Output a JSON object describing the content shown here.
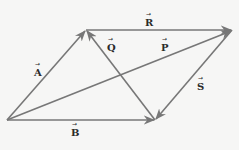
{
  "diagram": {
    "title": "",
    "colors": {
      "background": "#f6f6f5",
      "vector": "#777777",
      "label": "#2a2a2a"
    },
    "points": {
      "origin": [
        7,
        120
      ],
      "top_left": [
        86,
        30
      ],
      "top_right": [
        232,
        30
      ],
      "bottom_right": [
        155,
        120
      ]
    },
    "vectors": [
      {
        "name": "A",
        "label": "A",
        "from": "origin",
        "to": "top_left"
      },
      {
        "name": "R",
        "label": "R",
        "from": "top_left",
        "to": "top_right"
      },
      {
        "name": "B",
        "label": "B",
        "from": "origin",
        "to": "bottom_right"
      },
      {
        "name": "P",
        "label": "P",
        "from": "origin",
        "to": "top_right"
      },
      {
        "name": "Q",
        "label": "Q",
        "from": "bottom_right",
        "to": "top_left"
      },
      {
        "name": "S",
        "label": "S",
        "from": "top_right",
        "to": "bottom_right"
      }
    ],
    "labels": {
      "A": "A",
      "R": "R",
      "B": "B",
      "P": "P",
      "Q": "Q",
      "S": "S",
      "arrow_glyph": "→"
    }
  }
}
